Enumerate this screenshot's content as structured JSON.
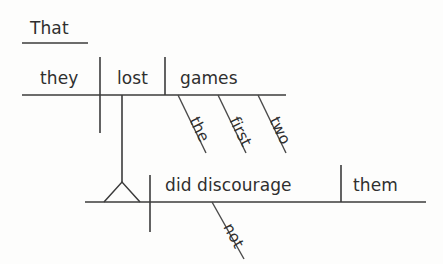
{
  "diagram": {
    "type": "reed-kellogg-sentence-diagram",
    "sentence": "That they lost the first two games did not discourage them.",
    "colors": {
      "line": "#3b3b3b",
      "text": "#2f2f2f",
      "background": "#fdfdfc"
    },
    "subordinate_clause": {
      "introducer": {
        "label": "That",
        "x": 30,
        "y": 20,
        "line": {
          "x1": 22,
          "y1": 43,
          "x2": 88,
          "y2": 43
        }
      },
      "baseline": {
        "x1": 22,
        "y1": 95,
        "x2": 286,
        "y2": 95
      },
      "subject": {
        "label": "they",
        "x": 40,
        "y": 66
      },
      "verb": {
        "label": "lost",
        "x": 117,
        "y": 66
      },
      "object": {
        "label": "games",
        "x": 180,
        "y": 66
      },
      "dividers": [
        {
          "name": "subject-verb-divider",
          "x": 100,
          "y1": 57,
          "y2": 133,
          "crosses": true
        },
        {
          "name": "verb-object-divider",
          "x": 165,
          "y1": 57,
          "y2": 95,
          "crosses": false
        }
      ],
      "modifiers": [
        {
          "label": "the",
          "x1": 178,
          "y1": 95,
          "x2": 205,
          "y2": 152,
          "angle": 64
        },
        {
          "label": "first",
          "x1": 218,
          "y1": 95,
          "x2": 245,
          "y2": 152,
          "angle": 64
        },
        {
          "label": "two",
          "x1": 258,
          "y1": 95,
          "x2": 285,
          "y2": 152,
          "angle": 64
        }
      ],
      "connector": {
        "name": "clause-connector",
        "x": 122,
        "y1": 95,
        "y2": 182
      },
      "pedestal": {
        "name": "pedestal-triangle",
        "apex_x": 122,
        "apex_y": 182,
        "left_x": 104,
        "right_x": 140,
        "base_y": 202
      }
    },
    "main_clause": {
      "baseline": {
        "x1": 85,
        "y1": 202,
        "x2": 426,
        "y2": 202
      },
      "verb": {
        "label": "did discourage",
        "x": 165,
        "y": 173
      },
      "object": {
        "label": "them",
        "x": 353,
        "y": 173
      },
      "dividers": [
        {
          "name": "subject-verb-divider",
          "x": 150,
          "y1": 175,
          "y2": 232,
          "crosses": true
        },
        {
          "name": "verb-object-divider",
          "x": 341,
          "y1": 165,
          "y2": 202,
          "crosses": false
        }
      ],
      "modifiers": [
        {
          "label": "not",
          "x1": 212,
          "y1": 202,
          "x2": 243,
          "y2": 258,
          "angle": 62
        }
      ]
    }
  }
}
